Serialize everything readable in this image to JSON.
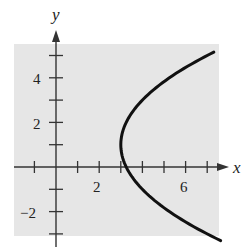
{
  "chart_data": {
    "type": "line",
    "title": "",
    "xlabel": "x",
    "ylabel": "y",
    "xlim": [
      -1.9,
      7.6
    ],
    "ylim": [
      -3.6,
      5.6
    ],
    "grid": false,
    "background_panel": "#e6e6e6",
    "curve_color": "#111111",
    "x_ticks": [
      -1,
      0,
      1,
      2,
      3,
      4,
      5,
      6,
      7
    ],
    "x_tick_labels": [
      {
        "value": 2,
        "label": "2"
      },
      {
        "value": 6,
        "label": "6"
      }
    ],
    "y_ticks": [
      -3,
      -2,
      -1,
      0,
      1,
      2,
      3,
      4,
      5
    ],
    "y_tick_labels": [
      {
        "value": 4,
        "label": "4"
      },
      {
        "value": 2,
        "label": "2"
      },
      {
        "value": -2,
        "label": "−2"
      }
    ],
    "series": [
      {
        "name": "parabola",
        "equation": "x = (y - 1)^2 / 4 + 3",
        "vertex": [
          3,
          1
        ],
        "opens": "right",
        "y_range": [
          -3.3,
          5.15
        ],
        "points": [
          {
            "x": 7.36,
            "y": -3.3
          },
          {
            "x": 6.0,
            "y": -2.46
          },
          {
            "x": 5.0,
            "y": -1.83
          },
          {
            "x": 4.0,
            "y": -1.0
          },
          {
            "x": 3.25,
            "y": 0.0
          },
          {
            "x": 3.0,
            "y": 1.0
          },
          {
            "x": 3.25,
            "y": 2.0
          },
          {
            "x": 4.0,
            "y": 3.0
          },
          {
            "x": 5.0,
            "y": 3.83
          },
          {
            "x": 6.0,
            "y": 4.46
          },
          {
            "x": 7.3,
            "y": 5.15
          }
        ]
      }
    ]
  },
  "labels": {
    "x_axis": "x",
    "y_axis": "y",
    "tick_2": "2",
    "tick_6": "6",
    "tick_y4": "4",
    "tick_y2": "2",
    "tick_ym2": "−2"
  }
}
